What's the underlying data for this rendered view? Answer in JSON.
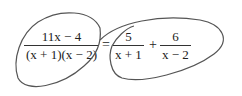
{
  "expression": {
    "lhs": {
      "numerator": "11x − 4",
      "denominator": "(x + 1)(x − 2)"
    },
    "equals": "=",
    "rhs": [
      {
        "numerator": "5",
        "denominator": "x + 1"
      },
      {
        "operator": "+"
      },
      {
        "numerator": "6",
        "denominator": "x − 2"
      }
    ]
  },
  "annotations": {
    "loop_color": "#555555",
    "loops": [
      "left-loop-around-lhs",
      "right-loop-around-rhs"
    ]
  }
}
